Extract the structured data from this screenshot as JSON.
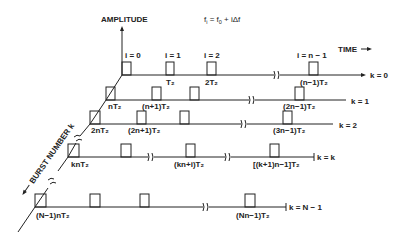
{
  "diagram": {
    "title_formula": "f_i = f_0 + iΔf",
    "axis_amplitude": "AMPLITUDE",
    "axis_time": "TIME",
    "axis_burst": "BURST NUMBER k",
    "pulse_index_labels": [
      "i = 0",
      "i = 1",
      "i = 2",
      "i = n − 1"
    ],
    "rows": [
      {
        "k_label": "k = 0",
        "times": [
          "",
          "T₂",
          "2T₂",
          "(n−1)T₂"
        ]
      },
      {
        "k_label": "k = 1",
        "times": [
          "nT₂",
          "(n+1)T₂",
          "",
          "(2n−1)T₂"
        ]
      },
      {
        "k_label": "k = 2",
        "times": [
          "2nT₂",
          "(2n+1)T₂",
          "",
          "(3n−1)T₂"
        ]
      },
      {
        "k_label": "k = k",
        "times": [
          "knT₂",
          "",
          "(kn+i)T₂",
          "[(k+1)n−1]T₂"
        ]
      },
      {
        "k_label": "k = N − 1",
        "times": [
          "(N−1)nT₂",
          "",
          "",
          "(Nn−1)T₂"
        ]
      }
    ]
  }
}
